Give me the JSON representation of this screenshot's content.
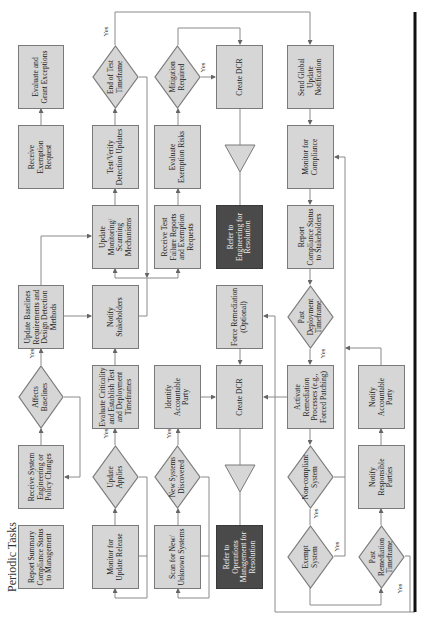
{
  "title": "Periodic Tasks",
  "yes_label": "Yes",
  "nodes": {
    "evaluate_grant_exceptions": "Evaluate and\nGrant Exceptions",
    "receive_exemption_request": "Receive\nExemption\nRequest",
    "update_baselines": "Update Baselines\nRequirements and\nDesign Detection\nMethods",
    "affects_baselines": "Affects\nBaselines",
    "receive_system_changes": "Receive System\nEngineering or\nPolicy Changes",
    "report_summary": "Report Summary\nCompliance Status\nto Management",
    "end_of_test_timeframe": "End of Test\nTimeframe",
    "test_verify_detection": "Test/Verify\nDetection Updates",
    "update_monitoring": "Update\nMonitoring/\nScanning\nMechanisms",
    "notify_stakeholders": "Notify\nStakeholders",
    "evaluate_criticality": "Evaluate Criticality\nand Establish Test\nand Deployment\nTimeframes",
    "update_applies": "Update\nApplies",
    "monitor_update_release": "Monitor for\nUpdate Release",
    "mitigation_required": "Mitigation\nRequired",
    "evaluate_exemption_risks": "Evaluate\nExemption Risks",
    "receive_test_failure": "Receive Test\nFailure Reports\nand Exemption\nRequests",
    "identify_accountable_party": "Identify\nAccountable\nParty",
    "new_systems_discovered": "New Systems\nDiscovered",
    "scan_new_systems": "Scan for New/\nUnknown Systems",
    "create_dcr_top": "Create DCR",
    "refer_engineering": "Refer to\nEngineering for\nResolution",
    "force_remediation": "Force Remediation\n(Optional)",
    "create_dcr_bottom": "Create DCR",
    "refer_operations": "Refer to\nOperations\nManagement for\nResolution",
    "send_global_update": "Send Global\nUpdate\nNotification",
    "monitor_compliance": "Monitor for\nCompliance",
    "report_compliance_status": "Report\nCompliance Status\nto Stakeholders",
    "past_deployment_timeframe": "Past\nDeployment\nTimeframe",
    "activate_remediation": "Activate\nRemediation\nProcesses (e.g.,\nForced Patching)",
    "non_compliant_system": "Non-compliant\nSystem",
    "exempt_system": "Exempt\nSystem",
    "notify_accountable_party": "Notify\nAccountable\nParty",
    "notify_responsible_parties": "Notify\nResponsible\nParties",
    "past_remediation_timeframe": "Past\nRemediation\nTimeframe"
  },
  "colors": {
    "box_fill": "#d6d6d6",
    "box_border": "#7a7a7a",
    "dark_fill": "#4a4a4a",
    "line": "#8a8a8a",
    "divider": "#111111"
  }
}
